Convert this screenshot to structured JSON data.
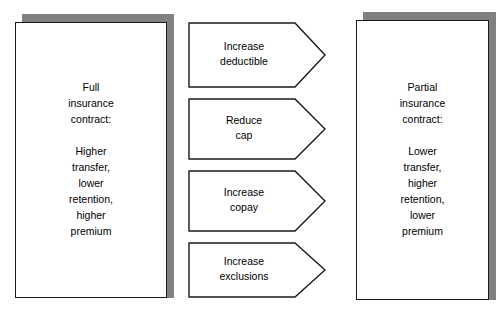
{
  "diagram": {
    "type": "process-flow",
    "left_node": {
      "name": "full-insurance-contract",
      "text": "Full\ninsurance\ncontract:\n\nHigher\ntransfer,\nlower\nretention,\nhigher\npremium"
    },
    "right_node": {
      "name": "partial-insurance-contract",
      "text": "Partial\ninsurance\ncontract:\n\nLower\ntransfer,\nhigher\nretention,\nlower\npremium"
    },
    "arrows": [
      {
        "name": "increase-deductible",
        "label": "Increase\ndeductible"
      },
      {
        "name": "reduce-cap",
        "label": "Reduce\ncap"
      },
      {
        "name": "increase-copay",
        "label": "Increase\ncopay"
      },
      {
        "name": "increase-exclusions",
        "label": "Increase\nexclusions"
      }
    ],
    "caption": "",
    "colors": {
      "outline": "#1a1a1a",
      "shadow": "#808080",
      "background": "#ffffff",
      "text": "#000000"
    }
  }
}
